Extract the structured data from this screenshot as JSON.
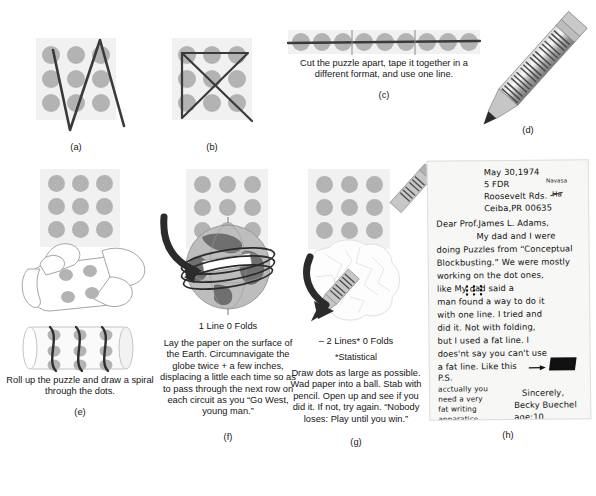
{
  "figure": {
    "colors": {
      "dot": "#b3b3b3",
      "card_background": "#f1f1f1",
      "line": "#3a3a3a",
      "ink": "#161616",
      "letter_paper": "#f7f7f5",
      "globe_land": "#6f6f6f",
      "globe_sea": "#bdbdbd",
      "pencil_body": "#8e8e8e"
    },
    "panels": [
      {
        "key": "a",
        "letter": "(a)",
        "caption": "",
        "headline": "",
        "solution_type": "four-line zigzag",
        "dot_grid": {
          "rows": 3,
          "cols": 3
        }
      },
      {
        "key": "b",
        "letter": "(b)",
        "caption": "",
        "headline": "",
        "solution_type": "bowtie / crossed lines",
        "dot_grid": {
          "rows": 3,
          "cols": 3
        }
      },
      {
        "key": "c",
        "letter": "(c)",
        "caption": "Cut the puzzle apart, tape it together in a different format, and use one line.",
        "headline": "",
        "solution_type": "cut and re-tape into one row",
        "dot_grid": {
          "rows": 1,
          "cols": 9
        },
        "cut_marks": 2
      },
      {
        "key": "d",
        "letter": "(d)",
        "caption": "",
        "headline": "",
        "solution_type": "very fat pencil"
      },
      {
        "key": "e",
        "letter": "(e)",
        "caption": "Roll up the puzzle and draw a spiral through the dots.",
        "headline": "",
        "solution_type": "roll into cylinder and spiral",
        "dot_grid": {
          "rows": 3,
          "cols": 3
        }
      },
      {
        "key": "f",
        "letter": "(f)",
        "headline": "1 Line 0 Folds",
        "caption": "Lay the paper on the surface of the Earth. Circumnavigate the globe twice + a few inches, displacing a little each time so as to pass through the next row on each circuit as you “Go West, young man.”",
        "solution_type": "circumnavigate the globe",
        "dot_grid": {
          "rows": 3,
          "cols": 3
        }
      },
      {
        "key": "g",
        "letter": "(g)",
        "headline": "– 2 Lines* 0 Folds",
        "subnote": "*Statistical",
        "caption": "Draw dots as large as possible. Wad paper into a ball. Stab with pencil. Open up and see if you did it. If not, try again. “Nobody loses: Play until you win.”",
        "solution_type": "wad paper and stab with pencil",
        "dot_grid": {
          "rows": 3,
          "cols": 3
        }
      },
      {
        "key": "h",
        "letter": "(h)",
        "caption": "",
        "headline": "",
        "solution_type": "handwritten letter with fat line"
      }
    ]
  },
  "letter": {
    "date": "May 30,1974",
    "address_line_1": "5 FDR",
    "address_insert": "Navasa",
    "address_line_2": "Roosevelt Rds.",
    "address_strikeout": "Ha",
    "address_line_3": "Ceiba,PR 00635",
    "salutation": "Dear Prof.James L. Adams,",
    "body": [
      "My dad and I were",
      "doing Puzzles from “Conceptual",
      "Blockbusting.” We were mostly",
      "working on the dot ones,",
      "like       My dad said a",
      "man found a way to do it",
      "with one line.  I tried and",
      "did it. Not with folding,",
      "but I used a fat line. I",
      "does'nt say you can't use",
      "a fat line.  Like this"
    ],
    "dot_sample_label": "nine-dot glyph",
    "fat_line_label": "fat line swatch",
    "ps_label": "P.S.",
    "ps_lines": [
      "acctually you",
      "need a very",
      "fat writing",
      "apparatice."
    ],
    "closing": "Sincerely,",
    "signature": "Becky Buechel",
    "age": "age:10"
  }
}
